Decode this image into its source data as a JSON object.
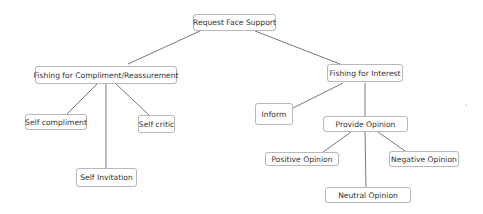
{
  "diagram": {
    "type": "tree",
    "root": "Request Face Support",
    "nodes": {
      "root": {
        "label": "Request Face Support",
        "x": 193,
        "y": 14,
        "w": 83,
        "h": 17
      },
      "compliment": {
        "label": "Fishing for Compliment/Reassurement",
        "x": 35,
        "y": 66,
        "w": 142,
        "h": 18
      },
      "interest": {
        "label": "Fishing for Interest",
        "x": 327,
        "y": 64,
        "w": 76,
        "h": 18
      },
      "self_compliment": {
        "label": "Self compliment",
        "x": 25,
        "y": 114,
        "w": 62,
        "h": 16
      },
      "self_critic": {
        "label": "Self critic",
        "x": 138,
        "y": 115,
        "w": 37,
        "h": 18
      },
      "self_invitation": {
        "label": "Self Invitation",
        "x": 76,
        "y": 168,
        "w": 61,
        "h": 19
      },
      "inform": {
        "label": "Inform",
        "x": 255,
        "y": 103,
        "w": 38,
        "h": 22
      },
      "provide_opinion": {
        "label": "Provide Opinion",
        "x": 323,
        "y": 116,
        "w": 85,
        "h": 16
      },
      "positive_opinion": {
        "label": "Positive Opinion",
        "x": 265,
        "y": 152,
        "w": 74,
        "h": 14
      },
      "negative_opinion": {
        "label": "Negative Opinion",
        "x": 389,
        "y": 151,
        "w": 70,
        "h": 16
      },
      "neutral_opinion": {
        "label": "Neutral Opinion",
        "x": 325,
        "y": 187,
        "w": 86,
        "h": 16
      }
    },
    "edges": [
      {
        "from": "root",
        "to": "compliment",
        "x1": 200,
        "y1": 31,
        "x2": 128,
        "y2": 64
      },
      {
        "from": "root",
        "to": "interest",
        "x1": 255,
        "y1": 31,
        "x2": 340,
        "y2": 64
      },
      {
        "from": "compliment",
        "to": "self_compliment",
        "x1": 97,
        "y1": 84,
        "x2": 67,
        "y2": 114
      },
      {
        "from": "compliment",
        "to": "self_invitation",
        "x1": 106,
        "y1": 84,
        "x2": 106,
        "y2": 168
      },
      {
        "from": "compliment",
        "to": "self_critic",
        "x1": 116,
        "y1": 84,
        "x2": 149,
        "y2": 115
      },
      {
        "from": "interest",
        "to": "inform",
        "x1": 343,
        "y1": 83,
        "x2": 293,
        "y2": 108
      },
      {
        "from": "interest",
        "to": "provide_opinion",
        "x1": 365,
        "y1": 83,
        "x2": 365,
        "y2": 116
      },
      {
        "from": "provide_opinion",
        "to": "positive_opinion",
        "x1": 351,
        "y1": 132,
        "x2": 323,
        "y2": 152
      },
      {
        "from": "provide_opinion",
        "to": "neutral_opinion",
        "x1": 365,
        "y1": 132,
        "x2": 366,
        "y2": 187
      },
      {
        "from": "provide_opinion",
        "to": "negative_opinion",
        "x1": 378,
        "y1": 132,
        "x2": 405,
        "y2": 151
      }
    ]
  },
  "colors": {
    "background": "#ffffff",
    "node_border": "#b9b9b9",
    "node_text": "#333333",
    "edge": "#555555"
  }
}
